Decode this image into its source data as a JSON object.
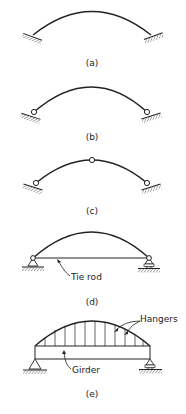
{
  "figure": {
    "panels": [
      {
        "id": "a",
        "caption": "(a)",
        "description": "Fixed (hingeless) arch"
      },
      {
        "id": "b",
        "caption": "(b)",
        "description": "Two-hinged arch"
      },
      {
        "id": "c",
        "caption": "(c)",
        "description": "Three-hinged arch"
      },
      {
        "id": "d",
        "caption": "(d)",
        "description": "Tied arch",
        "labels": {
          "tie_rod": "Tie rod"
        }
      },
      {
        "id": "e",
        "caption": "(e)",
        "description": "Arch with hangers and girder",
        "labels": {
          "hangers": "Hangers",
          "girder": "Girder"
        }
      }
    ]
  },
  "colors": {
    "line": "#222222",
    "background": "#ffffff"
  }
}
